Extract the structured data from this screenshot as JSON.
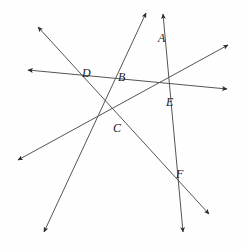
{
  "figure": {
    "type": "geometric-line-diagram",
    "width": 242,
    "height": 251,
    "background_color": "#fefefe",
    "line_color": "#555555",
    "label_color": "#1a1a1a",
    "line_width": 1,
    "labels": [
      {
        "text": "A",
        "x": 158,
        "y": 32
      },
      {
        "text": "B",
        "x": 118,
        "y": 71
      },
      {
        "text": "D",
        "x": 82,
        "y": 67
      },
      {
        "text": "E",
        "x": 166,
        "y": 96
      },
      {
        "text": "C",
        "x": 113,
        "y": 122
      },
      {
        "text": "F",
        "x": 176,
        "y": 168
      }
    ],
    "points": [
      {
        "name": "A",
        "x": 154,
        "y": 24
      },
      {
        "name": "B",
        "x": 128,
        "y": 76
      },
      {
        "name": "C",
        "x": 114,
        "y": 108
      },
      {
        "name": "D",
        "x": 76,
        "y": 73
      },
      {
        "name": "E",
        "x": 158,
        "y": 86
      },
      {
        "name": "F",
        "x": 168,
        "y": 177
      }
    ],
    "lines": [
      {
        "name": "horizontal-line-DBE",
        "through": [
          "D",
          "B",
          "E"
        ],
        "x1": 28,
        "y1": 70,
        "x2": 227,
        "y2": 89,
        "arrow_start": true,
        "arrow_end": true
      },
      {
        "name": "line-DCF",
        "through": [
          "D",
          "C",
          "F"
        ],
        "x1": 38,
        "y1": 27,
        "x2": 209,
        "y2": 214,
        "arrow_start": true,
        "arrow_end": true
      },
      {
        "name": "line-CBA",
        "through": [
          "C",
          "B",
          "A"
        ],
        "x1": 44,
        "y1": 232,
        "x2": 146,
        "y2": 13,
        "arrow_start": true,
        "arrow_end": true
      },
      {
        "name": "line-CE",
        "through": [
          "C",
          "E"
        ],
        "x1": 18,
        "y1": 160,
        "x2": 228,
        "y2": 45,
        "arrow_start": true,
        "arrow_end": true
      },
      {
        "name": "line-AEF",
        "through": [
          "A",
          "E",
          "F"
        ],
        "x1": 163,
        "y1": 14,
        "x2": 183,
        "y2": 232,
        "arrow_start": true,
        "arrow_end": true
      }
    ]
  }
}
